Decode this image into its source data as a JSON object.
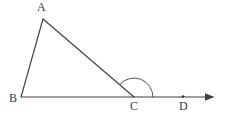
{
  "figure": {
    "type": "geometry-diagram",
    "stroke_color": "#3f3f3f",
    "label_color": "#3a3a3a",
    "background_color": "#ffffff",
    "canvas": {
      "width": 226,
      "height": 116
    },
    "points": [
      {
        "id": "A",
        "label": "A",
        "x": 43,
        "y": 19,
        "dot": false
      },
      {
        "id": "B",
        "label": "B",
        "x": 21,
        "y": 97,
        "dot": false
      },
      {
        "id": "C",
        "label": "C",
        "x": 134,
        "y": 97,
        "dot": false
      },
      {
        "id": "D",
        "label": "D",
        "x": 183,
        "y": 97,
        "dot": true
      }
    ],
    "segments": [
      {
        "id": "AB",
        "from": "A",
        "to": "B",
        "x1": 43,
        "y1": 19,
        "x2": 21,
        "y2": 97
      },
      {
        "id": "AC",
        "from": "A",
        "to": "C",
        "x1": 43,
        "y1": 19,
        "x2": 134,
        "y2": 97
      },
      {
        "id": "BD-ray",
        "from": "B",
        "to": "arrow-tip",
        "x1": 21,
        "y1": 97,
        "x2": 207,
        "y2": 97
      }
    ],
    "ray_arrow": {
      "id": "arrowhead",
      "tip_x": 214,
      "tip_y": 97,
      "points": "206,93.5 214,97 206,100.5"
    },
    "angle_arc": {
      "id": "angle-ACD",
      "at_point": "C",
      "center_x": 134,
      "center_y": 97,
      "radius": 19,
      "start_x": 119.7,
      "start_y": 84.5,
      "end_x": 153,
      "end_y": 97,
      "sweep_degrees": 139,
      "path": "M 119.7 84.5 A 19 19 0 0 1 153 97"
    },
    "point_dot_radius": 1.4,
    "stroke_width": 1.15
  }
}
